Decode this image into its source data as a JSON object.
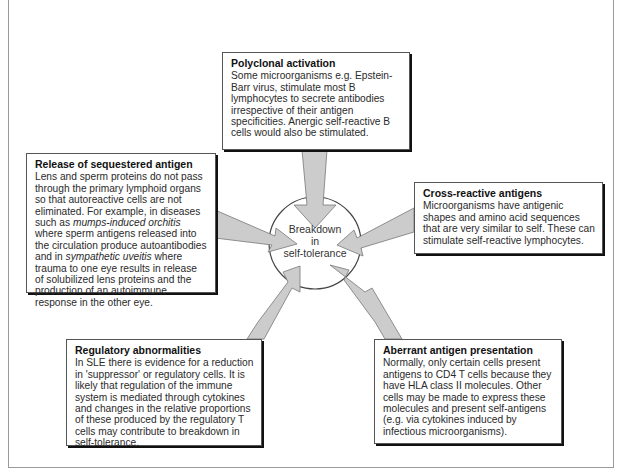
{
  "diagram": {
    "center": {
      "line1": "Breakdown",
      "line2": "in",
      "line3": "self-tolerance"
    },
    "boxes": {
      "top": {
        "title": "Polyclonal activation",
        "body": "Some microorganisms e.g. Epstein-Barr virus, stimulate most B lymphocytes to secrete antibodies irrespective of their antigen specificities. Anergic self-reactive B cells would also be stimulated."
      },
      "left": {
        "title": "Release of sequestered antigen",
        "body_parts": {
          "p1": "Lens and sperm proteins do not pass through the primary lymphoid organs so that autoreactive cells are not eliminated. For example, in diseases such as ",
          "i1": "mumps-induced orchitis",
          "p2": " where sperm antigens released into the circulation produce autoantibodies and in ",
          "i2": "sympathetic uveitis",
          "p3": " where trauma to one eye results in release of solubilized lens proteins and the production of an autoimmune response in the other eye."
        }
      },
      "right": {
        "title": "Cross-reactive antigens",
        "body": "Microorganisms have antigenic shapes and amino acid sequences that are very similar to self. These can stimulate self-reactive lymphocytes."
      },
      "bottom_left": {
        "title": "Regulatory abnormalities",
        "body": "In SLE there is evidence for a reduction in 'suppressor' or regulatory cells. It is likely that regulation of the immune system is mediated through cytokines and changes in the relative proportions of these produced by the regulatory T cells may contribute to breakdown in self-tolerance."
      },
      "bottom_right": {
        "title": "Aberrant antigen presentation",
        "body": "Normally, only certain cells present antigens to CD4 T cells because they have HLA class II molecules. Other cells may be made to express these molecules and present self-antigens (e.g. via cytokines induced by infectious microorganisms)."
      }
    },
    "colors": {
      "arrow_fill": "#cccccc",
      "arrow_stroke": "#777777",
      "box_border": "#555555",
      "shadow": "#111111"
    }
  }
}
